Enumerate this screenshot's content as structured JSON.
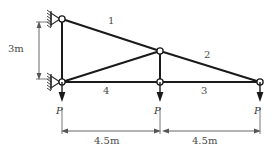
{
  "figure": {
    "type": "truss-structural-diagram",
    "members": [
      {
        "id": "1",
        "label": "1",
        "from": "top-left-joint",
        "to": "apex-joint",
        "label_x": 110,
        "label_y": 21
      },
      {
        "id": "2",
        "label": "2",
        "from": "apex-joint",
        "to": "right-joint",
        "label_x": 205,
        "label_y": 55
      },
      {
        "id": "3",
        "label": "3",
        "from": "bottom-mid-joint",
        "to": "right-joint",
        "label_x": 202,
        "label_y": 90
      },
      {
        "id": "4",
        "label": "4",
        "from": "bottom-left-joint",
        "to": "bottom-mid-joint",
        "label_x": 104,
        "label_y": 90
      }
    ],
    "joints": [
      {
        "name": "top-left-joint",
        "x": 62,
        "y": 19
      },
      {
        "name": "bottom-left-joint",
        "x": 62,
        "y": 82
      },
      {
        "name": "apex-joint",
        "x": 160,
        "y": 51
      },
      {
        "name": "bottom-mid-joint",
        "x": 160,
        "y": 82
      },
      {
        "name": "right-joint",
        "x": 260,
        "y": 82
      }
    ],
    "supports": [
      {
        "name": "top-left-support",
        "kind": "pin-hatched",
        "x": 62,
        "y": 19
      },
      {
        "name": "bottom-left-support",
        "kind": "pin-hatched",
        "x": 62,
        "y": 82
      }
    ],
    "loads": [
      {
        "name": "load-left",
        "label": "P",
        "x": 62,
        "label_x": 57,
        "label_y": 104
      },
      {
        "name": "load-mid",
        "label": "P",
        "x": 160,
        "label_x": 155,
        "label_y": 104
      },
      {
        "name": "load-right",
        "label": "P",
        "x": 260,
        "label_x": 255,
        "label_y": 104
      }
    ],
    "dimensions": [
      {
        "name": "height-dimension",
        "label": "3m",
        "orientation": "vertical",
        "label_x": 10,
        "label_y": 44
      },
      {
        "name": "span-left-dimension",
        "label": "4.5m",
        "orientation": "horizontal",
        "label_x": 95,
        "label_y": 136
      },
      {
        "name": "span-right-dimension",
        "label": "4.5m",
        "orientation": "horizontal",
        "label_x": 193,
        "label_y": 136
      }
    ],
    "caption": "",
    "colors": {
      "line": "#1a1a1a",
      "text": "#3d3d3d",
      "dimension": "#555555",
      "joint_fill": "#ffffff",
      "background": "#ffffff"
    }
  }
}
